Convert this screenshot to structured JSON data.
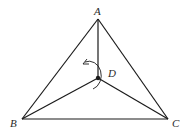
{
  "diagram": {
    "title": "",
    "points": {
      "A": {
        "label": "A",
        "x": 98,
        "y": 19
      },
      "B": {
        "label": "B",
        "x": 22,
        "y": 119
      },
      "C": {
        "label": "C",
        "x": 168,
        "y": 119
      },
      "D": {
        "label": "D",
        "x": 98,
        "y": 78
      }
    },
    "labels": {
      "A": "A",
      "B": "B",
      "C": "C",
      "D": "D"
    },
    "segments": [
      [
        "A",
        "B"
      ],
      [
        "B",
        "C"
      ],
      [
        "C",
        "A"
      ],
      [
        "A",
        "D"
      ],
      [
        "B",
        "D"
      ],
      [
        "C",
        "D"
      ]
    ],
    "annotations": {
      "rotation_arc": "curved arrow around point D indicating rotation (counterclockwise)"
    },
    "colors": {
      "line": "#1a1a1a",
      "background": "#ffffff"
    }
  }
}
